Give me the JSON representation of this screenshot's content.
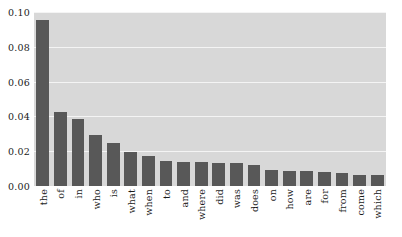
{
  "chart_data": {
    "type": "bar",
    "title": "",
    "subtitle": "",
    "xlabel": "",
    "ylabel": "",
    "grid": true,
    "legend": null,
    "ylim": [
      0.0,
      0.1
    ],
    "ytick_labels": [
      "0.00",
      "0.02",
      "0.04",
      "0.06",
      "0.08",
      "0.10"
    ],
    "ytick_values": [
      0.0,
      0.02,
      0.04,
      0.06,
      0.08,
      0.1
    ],
    "categories": [
      "the",
      "of",
      "in",
      "who",
      "is",
      "what",
      "when",
      "to",
      "and",
      "where",
      "did",
      "was",
      "does",
      "on",
      "how",
      "are",
      "for",
      "from",
      "come",
      "which"
    ],
    "values": [
      0.0955,
      0.0425,
      0.0385,
      0.0295,
      0.025,
      0.0195,
      0.017,
      0.0143,
      0.014,
      0.014,
      0.0133,
      0.013,
      0.0118,
      0.0093,
      0.0088,
      0.0085,
      0.0082,
      0.0072,
      0.0062,
      0.0062
    ],
    "colors": {
      "bar": "#585858",
      "plot_background": "#d8d8d8",
      "gridline": "#f4f4f4",
      "figure_background": "#ffffff",
      "text": "#1a1a1a"
    }
  }
}
